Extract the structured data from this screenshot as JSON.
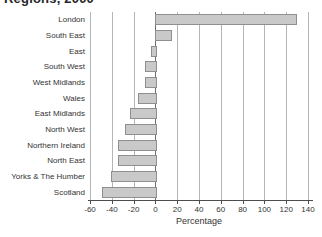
{
  "page": {
    "title_visible": "Regions, 2000"
  },
  "chart_data": {
    "type": "bar",
    "orientation": "horizontal",
    "title": "Regions, 2000",
    "categories": [
      "London",
      "South East",
      "East",
      "South West",
      "West Midlands",
      "Wales",
      "East Midlands",
      "North West",
      "Northern Ireland",
      "North East",
      "Yorks & The Humber",
      "Scotland"
    ],
    "values": [
      128,
      13,
      -4,
      -10,
      -10,
      -16,
      -23,
      -28,
      -34,
      -34,
      -41,
      -49
    ],
    "xlabel": "Percentage",
    "xlim": [
      -60,
      140
    ],
    "xticks": [
      -60,
      -40,
      -20,
      0,
      20,
      40,
      60,
      80,
      100,
      120,
      140
    ],
    "grid": true,
    "legend": "none",
    "bar_color": "#c9c9c9",
    "bar_border_color": "#8f8f8f",
    "gridline_color": "#b5b5b5",
    "axis_color": "#4d4d4d",
    "text_color": "#333333"
  }
}
